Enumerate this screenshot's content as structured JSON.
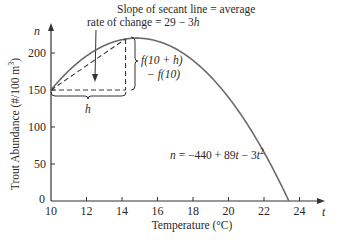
{
  "chart_data": {
    "type": "line",
    "title": "",
    "xlabel": "Temperature (°C)",
    "ylabel": "Trout Abundance (#/100 m³)",
    "x_axis_symbol": "t",
    "y_axis_symbol": "n",
    "xlim": [
      10,
      25
    ],
    "ylim": [
      0,
      230
    ],
    "x_ticks": [
      10,
      12,
      14,
      16,
      18,
      20,
      22,
      24
    ],
    "y_ticks": [
      0,
      50,
      100,
      150,
      200
    ],
    "x_tick_labels": [
      "10",
      "12",
      "14",
      "16",
      "18",
      "20",
      "22",
      "24"
    ],
    "y_tick_labels": [
      "0",
      "50",
      "100",
      "150",
      "200"
    ],
    "grid": false,
    "series": [
      {
        "name": "n = −440 + 89t − 3t²",
        "function": "n = -440 + 89t - 3t^2",
        "x": [
          10,
          11,
          12,
          13,
          14,
          14.83,
          16,
          17,
          18,
          19,
          20,
          21,
          22,
          23,
          23.4
        ],
        "values": [
          150,
          176,
          196,
          210,
          218,
          220.1,
          216,
          206,
          190,
          168,
          140,
          106,
          66,
          20,
          0
        ]
      }
    ],
    "secant": {
      "from": {
        "t": 10,
        "n": 150
      },
      "to": {
        "t": 14.2,
        "n": 219
      },
      "style": "dashed"
    },
    "annotations": [
      {
        "text_line1": "Slope of secant line = average",
        "text_line2_prefix": "rate of change = 29 − 3",
        "text_line2_var": "h"
      },
      {
        "text": "f(10 + h) − f(10)",
        "line1": "f(10 + h)",
        "line2": "− f(10)"
      },
      {
        "text": "h"
      },
      {
        "text": "n = −440 + 89t − 3t²"
      }
    ]
  },
  "labels": {
    "y_axis_title": "Trout Abundance (#/100 m³)",
    "y_axis_title_main": "Trout Abundance (#/100 m",
    "y_axis_title_sup": "3",
    "y_axis_title_end": ")",
    "x_axis_title": "Temperature (°C)",
    "y_symbol": "n",
    "x_symbol": "t",
    "origin": "0",
    "secant_note_line1": "Slope of secant line = average",
    "secant_note_line2": "rate of change = 29 − 3",
    "secant_note_var": "h",
    "rise_line1": "f(10 + h)",
    "rise_line2": "− f(10)",
    "run_label": "h",
    "equation_lhs": "n",
    "equation_rhs": " = −440 + 89",
    "equation_t": "t",
    "equation_minus": " − 3",
    "equation_t2": "t",
    "equation_exp": "2"
  },
  "colors": {
    "curve": "#6b6b6b",
    "axis": "#333333",
    "text": "#2a2a2a",
    "dashed": "#3a3a3a"
  }
}
